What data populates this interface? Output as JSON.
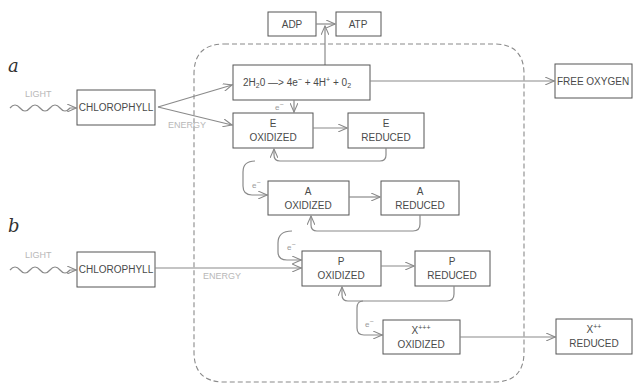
{
  "panels": {
    "a": {
      "label": "a"
    },
    "b": {
      "label": "b"
    }
  },
  "labels": {
    "light": "LIGHT",
    "energy": "ENERGY",
    "electron": "e",
    "electron_sup": "−"
  },
  "nodes": {
    "chlorophyll_a": {
      "text": "CHLOROPHYLL"
    },
    "chlorophyll_b": {
      "text": "CHLOROPHYLL"
    },
    "adp": {
      "text": "ADP"
    },
    "atp": {
      "text": "ATP"
    },
    "water_reaction": {
      "part1": "2H",
      "sub1": "2",
      "part2": "0 —> 4e",
      "sup1": "−",
      "part3": " + 4H",
      "sup2": "+",
      "part4": " + 0",
      "sub2": "2"
    },
    "free_oxygen": {
      "text": "FREE OXYGEN"
    },
    "e_oxidized": {
      "line1": "E",
      "line2": "OXIDIZED"
    },
    "e_reduced": {
      "line1": "E",
      "line2": "REDUCED"
    },
    "a_oxidized": {
      "line1": "A",
      "line2": "OXIDIZED"
    },
    "a_reduced": {
      "line1": "A",
      "line2": "REDUCED"
    },
    "p_oxidized": {
      "line1": "P",
      "line2": "OXIDIZED"
    },
    "p_reduced": {
      "line1": "P",
      "line2": "REDUCED"
    },
    "x_oxidized": {
      "line1": "X",
      "line1_sup": "+++",
      "line2": "OXIDIZED"
    },
    "x_reduced": {
      "line1": "X",
      "line1_sup": "++",
      "line2": "REDUCED"
    }
  },
  "colors": {
    "box_stroke": "#555555",
    "arrow": "#8a8a8a",
    "faint_label": "#b8b8b8",
    "text": "#4a4a4a"
  }
}
